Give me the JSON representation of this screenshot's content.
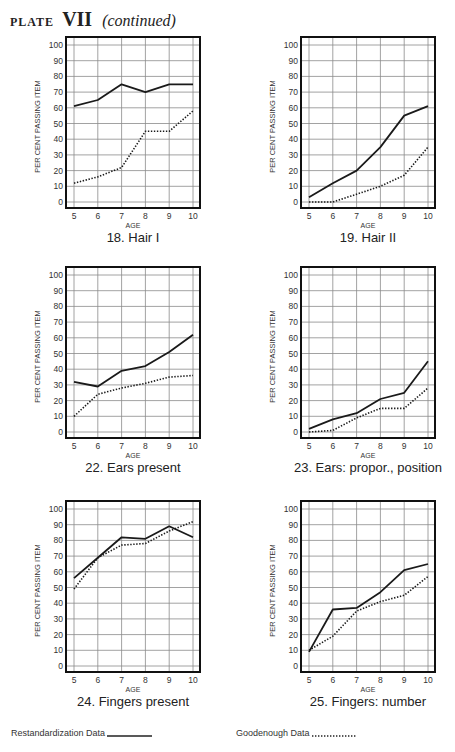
{
  "page": {
    "plate_label": "PLATE",
    "plate_number": "VII",
    "plate_suffix": "(continued)"
  },
  "axis": {
    "ylabel": "PER CENT PASSING ITEM",
    "xlabel": "AGE",
    "yticks": [
      0,
      10,
      20,
      30,
      40,
      50,
      60,
      70,
      80,
      90,
      100
    ],
    "xticks": [
      5,
      6,
      7,
      8,
      9,
      10
    ]
  },
  "legend": {
    "solid_label": "Restandardization Data",
    "dotted_label": "Goodenough Data"
  },
  "colors": {
    "line": "#1a1a1a",
    "grid": "#8a8a8a",
    "frame": "#111111"
  },
  "chart_data": [
    {
      "type": "line",
      "title": "18.  Hair I",
      "xlabel": "AGE",
      "ylabel": "PER CENT PASSING ITEM",
      "x": [
        5,
        6,
        7,
        8,
        9,
        10
      ],
      "ylim": [
        0,
        100
      ],
      "grid": true,
      "series": [
        {
          "name": "Restandardization Data",
          "style": "solid",
          "values": [
            61,
            65,
            75,
            70,
            75,
            75
          ]
        },
        {
          "name": "Goodenough Data",
          "style": "dotted",
          "values": [
            12,
            16,
            22,
            45,
            45,
            58
          ]
        }
      ]
    },
    {
      "type": "line",
      "title": "19.  Hair II",
      "xlabel": "AGE",
      "ylabel": "PER CENT PASSING ITEM",
      "x": [
        5,
        6,
        7,
        8,
        9,
        10
      ],
      "ylim": [
        0,
        100
      ],
      "grid": true,
      "series": [
        {
          "name": "Restandardization Data",
          "style": "solid",
          "values": [
            3,
            12,
            20,
            35,
            55,
            61
          ]
        },
        {
          "name": "Goodenough Data",
          "style": "dotted",
          "values": [
            0,
            0,
            5,
            10,
            17,
            35
          ]
        }
      ]
    },
    {
      "type": "line",
      "title": "22.  Ears present",
      "xlabel": "AGE",
      "ylabel": "PER CENT PASSING ITEM",
      "x": [
        5,
        6,
        7,
        8,
        9,
        10
      ],
      "ylim": [
        0,
        100
      ],
      "grid": true,
      "series": [
        {
          "name": "Restandardization Data",
          "style": "solid",
          "values": [
            32,
            29,
            39,
            42,
            51,
            62
          ]
        },
        {
          "name": "Goodenough Data",
          "style": "dotted",
          "values": [
            10,
            24,
            28,
            31,
            35,
            36
          ]
        }
      ]
    },
    {
      "type": "line",
      "title": "23. Ears: propor., position",
      "xlabel": "AGE",
      "ylabel": "PER CENT PASSING ITEM",
      "x": [
        5,
        6,
        7,
        8,
        9,
        10
      ],
      "ylim": [
        0,
        100
      ],
      "grid": true,
      "series": [
        {
          "name": "Restandardization Data",
          "style": "solid",
          "values": [
            2,
            8,
            12,
            21,
            25,
            45
          ]
        },
        {
          "name": "Goodenough Data",
          "style": "dotted",
          "values": [
            0,
            1,
            9,
            15,
            15,
            28
          ]
        }
      ]
    },
    {
      "type": "line",
      "title": "24.  Fingers present",
      "xlabel": "AGE",
      "ylabel": "PER CENT PASSING ITEM",
      "x": [
        5,
        6,
        7,
        8,
        9,
        10
      ],
      "ylim": [
        0,
        100
      ],
      "grid": true,
      "series": [
        {
          "name": "Restandardization Data",
          "style": "solid",
          "values": [
            56,
            69,
            82,
            81,
            89,
            82
          ]
        },
        {
          "name": "Goodenough Data",
          "style": "dotted",
          "values": [
            49,
            69,
            77,
            78,
            86,
            92
          ]
        }
      ]
    },
    {
      "type": "line",
      "title": "25.  Fingers: number",
      "xlabel": "AGE",
      "ylabel": "PER CENT PASSING ITEM",
      "x": [
        5,
        6,
        7,
        8,
        9,
        10
      ],
      "ylim": [
        0,
        100
      ],
      "grid": true,
      "series": [
        {
          "name": "Restandardization Data",
          "style": "solid",
          "values": [
            9,
            36,
            37,
            47,
            61,
            65
          ]
        },
        {
          "name": "Goodenough Data",
          "style": "dotted",
          "values": [
            10,
            19,
            35,
            41,
            45,
            57
          ]
        }
      ]
    }
  ]
}
